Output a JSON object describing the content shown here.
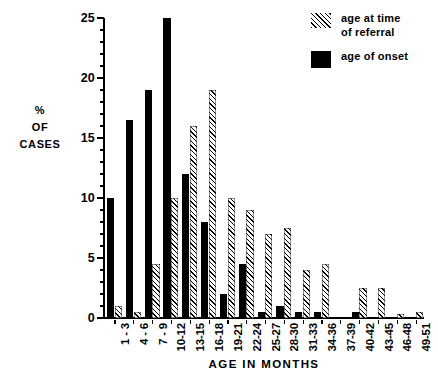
{
  "chart_data": {
    "type": "bar",
    "title": "",
    "xlabel": "AGE IN MONTHS",
    "ylabel": "% OF CASES",
    "ylabel_lines": [
      "%",
      "OF",
      "CASES"
    ],
    "ylim": [
      0,
      25
    ],
    "yticks": [
      0,
      5,
      10,
      15,
      20,
      25
    ],
    "ytick_labels": [
      "0",
      "5",
      "10",
      "15",
      "20",
      "25"
    ],
    "grid": false,
    "legend_position": "top-right",
    "categories": [
      "1 - 3",
      "4 - 6",
      "7 - 9",
      "10-12",
      "13-15",
      "16-18",
      "19-21",
      "22-24",
      "25-27",
      "28-30",
      "31-33",
      "34-36",
      "37-39",
      "40-42",
      "43-45",
      "46-48",
      "49-51"
    ],
    "series": [
      {
        "name": "age of onset",
        "style": "solid",
        "color": "#000000",
        "values": [
          10,
          16.5,
          19,
          25,
          12,
          8,
          2,
          4.5,
          0.5,
          1,
          0.5,
          0.5,
          0,
          0.5,
          0,
          0,
          0
        ]
      },
      {
        "name": "age at time of referral",
        "style": "hatched",
        "color": "#000000",
        "values": [
          1,
          0.5,
          4.5,
          10,
          16,
          19,
          10,
          9,
          7,
          7.5,
          4,
          4.5,
          0,
          2.5,
          2.5,
          0.3,
          0.5
        ]
      }
    ]
  },
  "legend": {
    "items": [
      {
        "label_lines": [
          "age at time",
          "of  referral"
        ],
        "swatch": "hatched-swatch"
      },
      {
        "label_lines": [
          "age of onset"
        ],
        "swatch": "solid-swatch"
      }
    ]
  }
}
